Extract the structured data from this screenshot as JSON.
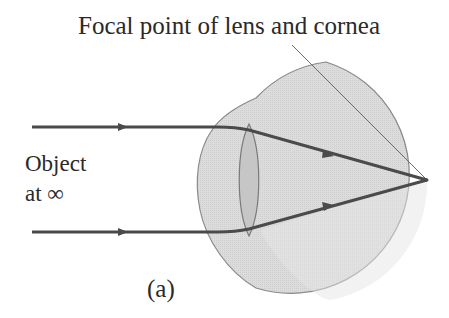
{
  "title_label": "Focal point of lens and cornea",
  "object_label_line1": "Object",
  "object_label_line2": "at ∞",
  "panel_label": "(a)",
  "colors": {
    "eye_fill": "#d9d9d9",
    "eye_outline": "#8a8a8a",
    "lens_fill": "#c8c8c8",
    "ray": "#4a4a4a",
    "text": "#2a2a2a"
  },
  "elements": {
    "eyeball": "circle",
    "lens": "biconvex-lens",
    "rays": [
      "top-parallel-ray",
      "bottom-parallel-ray"
    ],
    "focal_point": "retina-focus"
  }
}
